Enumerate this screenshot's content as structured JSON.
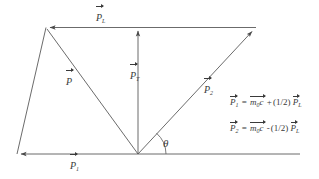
{
  "figure": {
    "type": "vector-diagram",
    "background_color": "#ffffff",
    "stroke_color": "#5a5a5a",
    "text_color": "#3a3a3a"
  },
  "vectors": [
    {
      "id": "p-longitudinal",
      "symbol": "P",
      "subscript": "L",
      "label_x": 96,
      "label_y": 8,
      "from": [
        138,
        27
      ],
      "to": [
        46,
        27
      ],
      "direction": "left-horizontal-top"
    },
    {
      "id": "p-transverse",
      "symbol": "P",
      "subscript": "T",
      "label_x": 130,
      "label_y": 66,
      "from": [
        138,
        154
      ],
      "to": [
        138,
        27
      ],
      "direction": "up-vertical"
    },
    {
      "id": "p-resultant",
      "symbol": "P",
      "subscript": "",
      "label_x": 66,
      "label_y": 72,
      "from": [
        138,
        154
      ],
      "to": [
        46,
        27
      ],
      "direction": "up-left-diagonal"
    },
    {
      "id": "p-two",
      "symbol": "P",
      "subscript": "2",
      "label_x": 204,
      "label_y": 80,
      "from": [
        138,
        154
      ],
      "to": [
        256,
        28
      ],
      "direction": "up-right-diagonal"
    },
    {
      "id": "p-one",
      "symbol": "P",
      "subscript": "1",
      "label_x": 70,
      "label_y": 156,
      "from": [
        138,
        154
      ],
      "to": [
        17,
        154
      ],
      "direction": "left-horizontal-bottom"
    }
  ],
  "angle": {
    "symbol": "θ",
    "label_x": 163,
    "label_y": 137,
    "vertex": [
      138,
      154
    ]
  },
  "equations": [
    {
      "id": "equation-p1",
      "lhs_symbol": "P",
      "lhs_subscript": "1",
      "equals": "=",
      "term1_symbol": "m",
      "term1_subscript": "0",
      "term1_factor": "c",
      "operator": "+",
      "coefficient": "(1/2)",
      "term2_symbol": "P",
      "term2_subscript": "L",
      "x": 230,
      "y": 98
    },
    {
      "id": "equation-p2",
      "lhs_symbol": "P",
      "lhs_subscript": "2",
      "equals": "=",
      "term1_symbol": "m",
      "term1_subscript": "0",
      "term1_factor": "c",
      "operator": "-",
      "coefficient": "(1/2)",
      "term2_symbol": "P",
      "term2_subscript": "L",
      "x": 230,
      "y": 124
    }
  ]
}
